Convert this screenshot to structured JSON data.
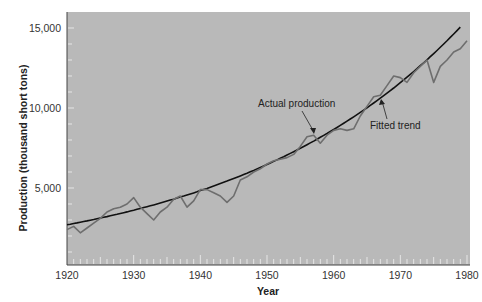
{
  "chart_data": {
    "type": "line",
    "title": "",
    "xlabel": "Year",
    "ylabel": "Production (thousand short tons)",
    "xlim": [
      1920,
      1981
    ],
    "ylim": [
      1000,
      15600
    ],
    "x_ticks": [
      1920,
      1930,
      1940,
      1950,
      1960,
      1970,
      1980
    ],
    "x_tick_labels": [
      "1920",
      "1930",
      "1940",
      "1950",
      "1960",
      "1970",
      "1980"
    ],
    "y_ticks": [
      5000,
      10000,
      15000
    ],
    "y_tick_labels": [
      "5,000",
      "10,000",
      "15,000"
    ],
    "grid": false,
    "legend": "none (inline annotations)",
    "series": [
      {
        "name": "Actual production",
        "color": "#6e6e6e",
        "x": [
          1920,
          1921,
          1922,
          1923,
          1924,
          1925,
          1926,
          1927,
          1928,
          1929,
          1930,
          1931,
          1932,
          1933,
          1934,
          1935,
          1936,
          1937,
          1938,
          1939,
          1940,
          1941,
          1942,
          1943,
          1944,
          1945,
          1946,
          1947,
          1948,
          1949,
          1950,
          1951,
          1952,
          1953,
          1954,
          1955,
          1956,
          1957,
          1958,
          1959,
          1960,
          1961,
          1962,
          1963,
          1964,
          1965,
          1966,
          1967,
          1968,
          1969,
          1970,
          1971,
          1972,
          1973,
          1974,
          1975,
          1976,
          1977,
          1978,
          1979,
          1980
        ],
        "values": [
          2400,
          2600,
          2200,
          2500,
          2800,
          3100,
          3500,
          3700,
          3800,
          4000,
          4400,
          3800,
          3400,
          3000,
          3500,
          3800,
          4300,
          4500,
          3800,
          4200,
          4900,
          4900,
          4700,
          4500,
          4100,
          4500,
          5500,
          5700,
          6000,
          6200,
          6500,
          6700,
          6800,
          6900,
          7100,
          7600,
          8200,
          8300,
          7800,
          8300,
          8600,
          8700,
          8600,
          8700,
          9500,
          10100,
          10700,
          10800,
          11400,
          12000,
          11900,
          11600,
          12200,
          12600,
          13000,
          11600,
          12600,
          13000,
          13500,
          13700,
          14200
        ]
      },
      {
        "name": "Fitted trend",
        "color": "#111111",
        "x": [
          1920,
          1925,
          1930,
          1935,
          1940,
          1945,
          1950,
          1955,
          1960,
          1965,
          1970,
          1975,
          1980
        ],
        "values": [
          2700,
          3050,
          3500,
          4000,
          4600,
          5300,
          6150,
          7150,
          8350,
          9800,
          11500,
          13400,
          15500
        ]
      }
    ],
    "annotations": [
      {
        "text": "Actual production",
        "points_to_year": 1957
      },
      {
        "text": "Fitted trend",
        "points_to_year": 1968
      }
    ]
  },
  "labels": {
    "ylabel": "Production (thousand short tons)",
    "xlabel": "Year",
    "annot_actual": "Actual production",
    "annot_trend": "Fitted trend"
  },
  "colors": {
    "plot_bg": "#b9b9b9",
    "actual_line": "#6e6e6e",
    "trend_line": "#111111",
    "tick_marks": "#e6e6e6"
  }
}
